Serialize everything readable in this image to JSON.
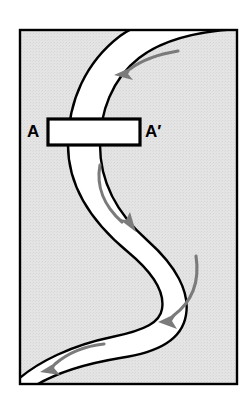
{
  "figure": {
    "type": "map",
    "frame": {
      "border_color": "#000000",
      "border_width_px": 2,
      "background_color": "#e3e3e3",
      "left": 19,
      "top": 29,
      "right": 238,
      "bottom": 385
    },
    "channel": {
      "fill_color": "#ffffff",
      "bank_line_color": "#000000",
      "bank_line_width_px": 2,
      "label": "river-channel"
    },
    "cross_section": {
      "name": "A-A'",
      "start_label": "A",
      "end_label": "A'",
      "box_color": "#000000",
      "box_fill": "#ffffff",
      "box_stroke_width_px": 3,
      "box": {
        "x": 48,
        "y": 119,
        "width": 92,
        "height": 26
      }
    },
    "flow_arrows": {
      "color": "#7b7b7b",
      "count": 4,
      "items": [
        {
          "name": "flow-arrow-top",
          "direction": "left",
          "segment": "upper bend, flow toward the west"
        },
        {
          "name": "flow-arrow-upper-middle",
          "direction": "down-right",
          "segment": "middle limb, flow toward the southeast"
        },
        {
          "name": "flow-arrow-lower-middle",
          "direction": "down-left",
          "segment": "lower bend, flow toward the southwest"
        },
        {
          "name": "flow-arrow-bottom",
          "direction": "left",
          "segment": "bottom limb, flow toward the west"
        }
      ]
    }
  },
  "labels": {
    "a": "A",
    "a_prime": "A′"
  },
  "colors": {
    "background": "#e3e3e3",
    "channel": "#ffffff",
    "outline": "#000000",
    "arrow": "#7b7b7b",
    "page": "#ffffff"
  }
}
